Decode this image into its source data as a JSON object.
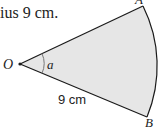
{
  "caption": {
    "text": "ius 9 cm."
  },
  "diagram": {
    "type": "sector",
    "labels": {
      "center": "O",
      "point_a": "A",
      "point_b": "B",
      "angle": "a",
      "radius": "9 cm"
    },
    "colors": {
      "fill": "#e6e6e6",
      "stroke": "#1a1a1a",
      "angle_arc": "#777777"
    }
  }
}
